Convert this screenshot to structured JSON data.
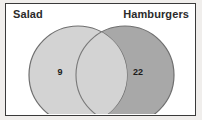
{
  "diagram": {
    "type": "venn",
    "title": "",
    "sets": [
      {
        "id": "salad",
        "label": "Salad",
        "only_count": "9",
        "fill_color": "#cfcfcf",
        "stroke_color": "#6f6f6f"
      },
      {
        "id": "hamburgers",
        "label": "Hamburgers",
        "only_count": "22",
        "fill_color": "#a8a8a8",
        "stroke_color": "#6f6f6f"
      }
    ],
    "intersection": {
      "count": "",
      "fill_color": "#d3d3d3"
    },
    "frame": {
      "border_color": "#3a3a3a",
      "background_color": "#ffffff",
      "page_background_color": "#f0eeec"
    },
    "text_color": "#2b2b2b"
  }
}
